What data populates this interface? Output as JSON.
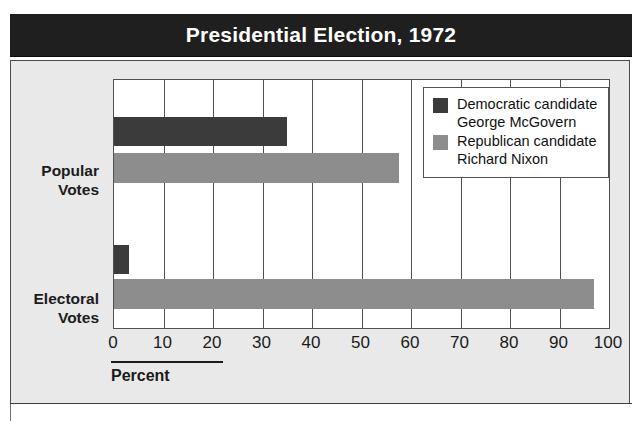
{
  "title": "Presidential Election, 1972",
  "axis": {
    "caption": "Percent"
  },
  "legend": {
    "items": [
      {
        "party": "Democratic candidate",
        "name": "George McGovern",
        "color": "#3c3b3b"
      },
      {
        "party": "Republican candidate",
        "name": "Richard Nixon",
        "color": "#8d8d8d"
      }
    ]
  },
  "categories": [
    {
      "line1": "Popular",
      "line2": "Votes"
    },
    {
      "line1": "Electoral",
      "line2": "Votes"
    }
  ],
  "ticks": [
    "0",
    "10",
    "20",
    "30",
    "40",
    "50",
    "60",
    "70",
    "80",
    "90",
    "100"
  ],
  "chart_data": {
    "type": "bar",
    "orientation": "horizontal",
    "title": "Presidential Election, 1972",
    "xlabel": "Percent",
    "ylabel": "",
    "xlim": [
      0,
      100
    ],
    "xticks": [
      0,
      10,
      20,
      30,
      40,
      50,
      60,
      70,
      80,
      90,
      100
    ],
    "grid": true,
    "legend_position": "top-right",
    "categories": [
      "Popular Votes",
      "Electoral Votes"
    ],
    "series": [
      {
        "name": "Democratic candidate George McGovern",
        "short_name": "George McGovern",
        "color": "#3c3b3b",
        "values": [
          35,
          3
        ]
      },
      {
        "name": "Republican candidate Richard Nixon",
        "short_name": "Richard Nixon",
        "color": "#8d8d8d",
        "values": [
          57.5,
          97
        ]
      }
    ]
  }
}
